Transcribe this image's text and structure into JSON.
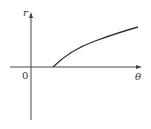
{
  "diagram": {
    "type": "polar-function-graph",
    "axes": {
      "vertical_label": "r",
      "horizontal_label": "θ",
      "origin_label": "0"
    },
    "curve": {
      "description": "increasing concave curve starting on θ-axis to the right of origin",
      "points": [
        [
          53,
          67
        ],
        [
          62,
          59
        ],
        [
          75,
          50
        ],
        [
          90,
          42
        ],
        [
          105,
          36
        ],
        [
          120,
          31
        ],
        [
          138,
          27
        ]
      ]
    },
    "colors": {
      "stroke": "#333333",
      "background": "#ffffff"
    }
  }
}
